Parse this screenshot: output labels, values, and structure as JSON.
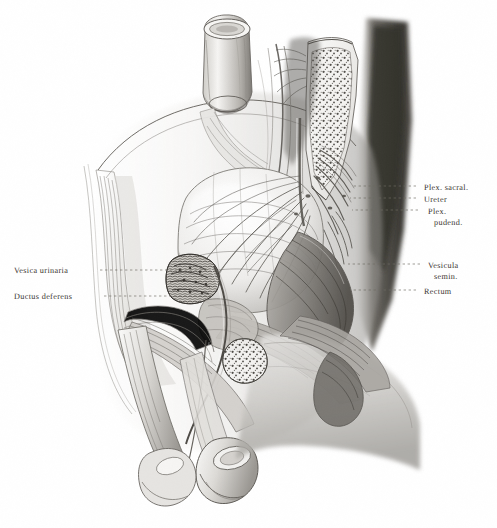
{
  "plate": {
    "type": "anatomical-illustration",
    "subject": "Male pelvis, median sagittal section",
    "style": "grayscale halftone lithograph",
    "background_color": "#ffffff",
    "ink_color": "#39342f",
    "leader_line_color": "#6e6a63",
    "width": 497,
    "height": 528
  },
  "labels": {
    "right": [
      {
        "id": "plex-sacral",
        "text": "Plex. sacral.",
        "text2": "",
        "x": 424,
        "y": 183,
        "leader_x1": 416,
        "leader_x2": 352,
        "leader_y": 186
      },
      {
        "id": "ureter",
        "text": "Ureter",
        "text2": "",
        "x": 424,
        "y": 195,
        "leader_x1": 416,
        "leader_x2": 350,
        "leader_y": 198
      },
      {
        "id": "plex-pudend",
        "text": "Plex.",
        "text2": "pudend.",
        "x": 428,
        "y": 207,
        "leader_x1": 418,
        "leader_x2": 352,
        "leader_y": 210
      },
      {
        "id": "vesicula-semin",
        "text": "Vesicula",
        "text2": "semin.",
        "x": 428,
        "y": 261,
        "leader_x1": 420,
        "leader_x2": 348,
        "leader_y": 264
      },
      {
        "id": "rectum",
        "text": "Rectum",
        "text2": "",
        "x": 424,
        "y": 287,
        "leader_x1": 416,
        "leader_x2": 350,
        "leader_y": 290
      }
    ],
    "left": [
      {
        "id": "vesica-urinaria",
        "text": "Vesica urinaria",
        "x": 14,
        "y": 266,
        "leader_x1": 100,
        "leader_x2": 208,
        "leader_y": 270
      },
      {
        "id": "ductus-deferens",
        "text": "Ductus deferens",
        "x": 14,
        "y": 292,
        "leader_x1": 104,
        "leader_x2": 212,
        "leader_y": 296
      }
    ]
  }
}
